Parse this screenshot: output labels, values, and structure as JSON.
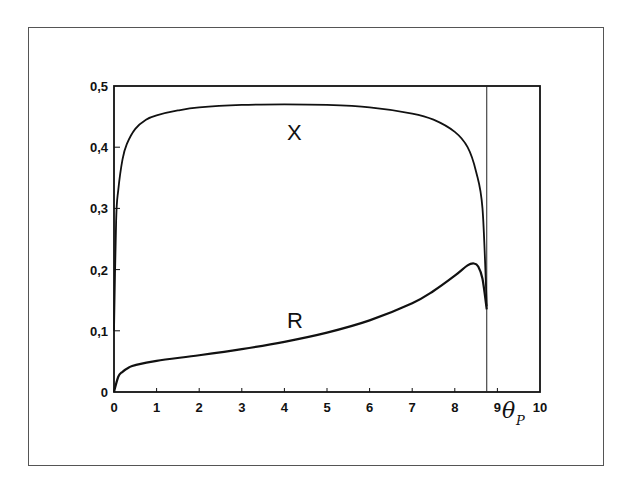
{
  "chart_data": {
    "type": "line",
    "title": "",
    "xlabel": "θ_P",
    "xlabel_main": "θ",
    "xlabel_sub": "P",
    "ylabel": "",
    "xlim": [
      0,
      10
    ],
    "ylim": [
      0,
      0.5
    ],
    "grid": false,
    "x_ticks": [
      "0",
      "1",
      "2",
      "3",
      "4",
      "5",
      "6",
      "7",
      "8",
      "9",
      "10"
    ],
    "y_ticks": [
      "0",
      "0,1",
      "0,2",
      "0,3",
      "0,4",
      "0,5"
    ],
    "vertical_line_x": 8.75,
    "series": [
      {
        "name": "X",
        "x": [
          0,
          0.05,
          0.1,
          0.2,
          0.3,
          0.5,
          0.75,
          1,
          1.5,
          2,
          3,
          4,
          5,
          6,
          7,
          7.5,
          8,
          8.3,
          8.5,
          8.65,
          8.75
        ],
        "values": [
          0.1,
          0.28,
          0.33,
          0.38,
          0.405,
          0.43,
          0.445,
          0.452,
          0.46,
          0.465,
          0.469,
          0.47,
          0.469,
          0.465,
          0.455,
          0.445,
          0.425,
          0.4,
          0.36,
          0.3,
          0.14
        ]
      },
      {
        "name": "R",
        "x": [
          0,
          0.1,
          0.2,
          0.35,
          0.5,
          1,
          2,
          3,
          4,
          5,
          6,
          7,
          7.5,
          8,
          8.3,
          8.45,
          8.55,
          8.65,
          8.75
        ],
        "values": [
          0,
          0.025,
          0.033,
          0.04,
          0.044,
          0.051,
          0.06,
          0.07,
          0.082,
          0.097,
          0.117,
          0.145,
          0.165,
          0.19,
          0.207,
          0.21,
          0.205,
          0.185,
          0.135
        ]
      }
    ],
    "annotations": [
      {
        "text": "X",
        "x": 4.2,
        "y": 0.41
      },
      {
        "text": "R",
        "x": 4.2,
        "y": 0.115
      }
    ]
  },
  "labels": {
    "curve_x": "X",
    "curve_r": "R",
    "xlabel_main": "θ",
    "xlabel_sub": "P"
  }
}
